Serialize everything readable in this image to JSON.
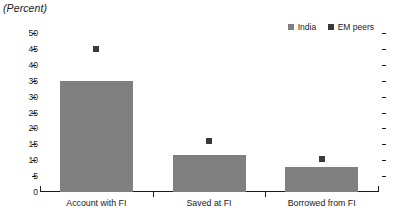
{
  "chart_data": {
    "type": "bar",
    "title": "(Percent)",
    "xlabel": "",
    "ylabel": "",
    "ylim": [
      0,
      50
    ],
    "ytick_step": 5,
    "yticks": [
      "0",
      "5",
      "10",
      "15",
      "20",
      "25",
      "30",
      "35",
      "40",
      "45",
      "50"
    ],
    "grid": false,
    "legend_position": "top-right",
    "categories": [
      "Account with FI",
      "Saved at FI",
      "Borrowed from FI"
    ],
    "series": [
      {
        "name": "India",
        "render": "bar",
        "color": "#808080",
        "values": [
          35,
          11.5,
          8
        ]
      },
      {
        "name": "EM peers",
        "render": "marker",
        "color": "#3a3a3a",
        "values": [
          45,
          16,
          10.3
        ]
      }
    ]
  },
  "legend": {
    "items": [
      {
        "label": "India",
        "color": "#808080"
      },
      {
        "label": "EM peers",
        "color": "#3a3a3a"
      }
    ]
  },
  "axis": {
    "line_color": "#1a1a1a"
  }
}
